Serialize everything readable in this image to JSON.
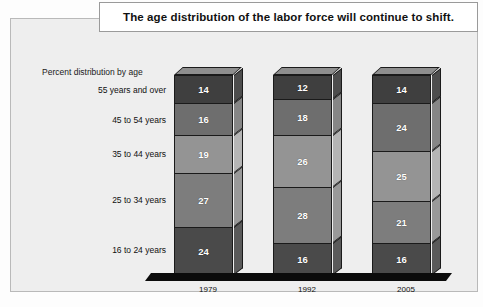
{
  "title": {
    "text": "The age distribution of the labor force will continue to shift."
  },
  "subtitle": {
    "text": "Percent distribution by age"
  },
  "colors": {
    "panel_background": "#eeeeee",
    "panel_border": "#b9b9b9",
    "title_background": "#ffffff",
    "title_border": "#9a9a9a",
    "ground": "#0b0b0b",
    "segment_outline": "#1a1a1a",
    "value_text": "#ffffff",
    "side_face": "#9b9b9b",
    "top_face": "#8e8e8e"
  },
  "chart_data": {
    "type": "bar",
    "title": "The age distribution of the labor force will continue to shift.",
    "subtitle": "Percent distribution by age",
    "xlabel": "",
    "ylabel": "Percent distribution by age",
    "stacked": true,
    "orientation": "vertical",
    "grid": false,
    "legend": "left-axis-labels",
    "ylim": [
      0,
      100
    ],
    "categories": [
      "1979",
      "1992",
      "2005"
    ],
    "series": [
      {
        "name": "16 to 24 years",
        "values": [
          24,
          16,
          16
        ],
        "color": "#4a4a4a"
      },
      {
        "name": "25 to 34 years",
        "values": [
          27,
          28,
          21
        ],
        "color": "#7d7d7d"
      },
      {
        "name": "35 to 44 years",
        "values": [
          19,
          26,
          25
        ],
        "color": "#949494"
      },
      {
        "name": "45 to 54 years",
        "values": [
          16,
          18,
          24
        ],
        "color": "#6e6e6e"
      },
      {
        "name": "55 years and over",
        "values": [
          14,
          12,
          14
        ],
        "color": "#3f3f3f"
      }
    ]
  },
  "axis": {
    "category_labels": [
      "55 years and over",
      "45 to 54 years",
      "35 to 44 years",
      "25 to 34 years",
      "16 to 24 years"
    ],
    "year_labels": [
      "1979",
      "1992",
      "2005"
    ]
  },
  "bars": [
    {
      "year": "1979",
      "segments": [
        {
          "label": "55 years and over",
          "value": "14",
          "color": "#3f3f3f"
        },
        {
          "label": "45 to 54 years",
          "value": "16",
          "color": "#6e6e6e"
        },
        {
          "label": "35 to 44 years",
          "value": "19",
          "color": "#949494"
        },
        {
          "label": "25 to 34 years",
          "value": "27",
          "color": "#7d7d7d"
        },
        {
          "label": "16 to 24 years",
          "value": "24",
          "color": "#4a4a4a"
        }
      ]
    },
    {
      "year": "1992",
      "segments": [
        {
          "label": "55 years and over",
          "value": "12",
          "color": "#3f3f3f"
        },
        {
          "label": "45 to 54 years",
          "value": "18",
          "color": "#6e6e6e"
        },
        {
          "label": "35 to 44 years",
          "value": "26",
          "color": "#949494"
        },
        {
          "label": "25 to 34 years",
          "value": "28",
          "color": "#7d7d7d"
        },
        {
          "label": "16 to 24 years",
          "value": "16",
          "color": "#4a4a4a"
        }
      ]
    },
    {
      "year": "2005",
      "segments": [
        {
          "label": "55 years and over",
          "value": "14",
          "color": "#3f3f3f"
        },
        {
          "label": "45 to 54 years",
          "value": "24",
          "color": "#6e6e6e"
        },
        {
          "label": "35 to 44 years",
          "value": "25",
          "color": "#949494"
        },
        {
          "label": "25 to 34 years",
          "value": "21",
          "color": "#7d7d7d"
        },
        {
          "label": "16 to 24 years",
          "value": "16",
          "color": "#4a4a4a"
        }
      ]
    }
  ],
  "layout": {
    "bar_lefts": [
      163,
      262,
      361
    ],
    "bar_width": 59,
    "stack_bottom": 256,
    "stack_top": 56,
    "label_rights": [
      155,
      155,
      155,
      155,
      155
    ],
    "label_tops": [
      66,
      96,
      130,
      176,
      226
    ]
  }
}
